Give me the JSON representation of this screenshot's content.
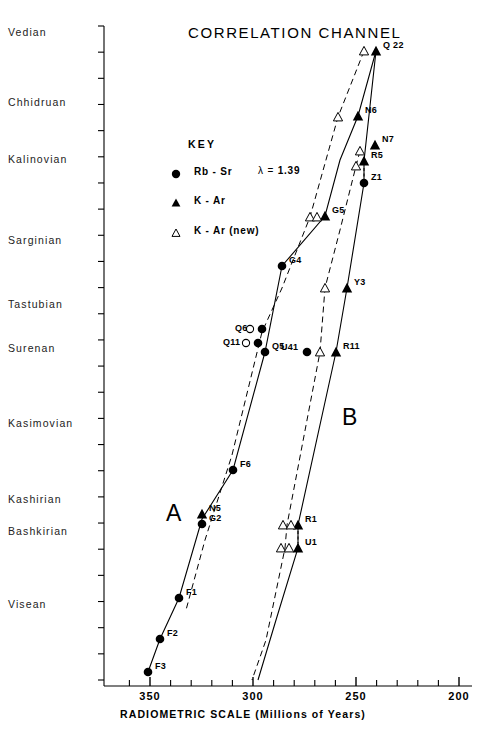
{
  "figure": {
    "title": "CORRELATION CHANNEL",
    "background": "#ffffff",
    "ink": "#000000"
  },
  "key": {
    "heading": "KEY",
    "entries": [
      {
        "symbol": "filled-circle",
        "label": "Rb - Sr",
        "extra_prefix": "λ =",
        "extra_value": "1.39"
      },
      {
        "symbol": "filled-triangle",
        "label": "K - Ar",
        "extra_prefix": "",
        "extra_value": ""
      },
      {
        "symbol": "open-triangle",
        "label": "K - Ar (new)",
        "extra_prefix": "",
        "extra_value": ""
      }
    ]
  },
  "chart_data": {
    "type": "scatter",
    "title": "CORRELATION CHANNEL",
    "xlabel": "RADIOMETRIC SCALE  (Millions of Years)",
    "ylabel": "",
    "xlim": [
      360,
      195
    ],
    "x_reversed": true,
    "grid": false,
    "legend_position": "upper-left-inside",
    "x_ticks_major": [
      350,
      300,
      250,
      200
    ],
    "x_tick_labels": [
      "350",
      "300",
      "250",
      "200"
    ],
    "x_ticks_minor": [
      360,
      340,
      330,
      320,
      310,
      290,
      280,
      270,
      260,
      240,
      230,
      220,
      210
    ],
    "y_axis": {
      "type": "stratigraphic-stages",
      "stages": [
        {
          "name": "Vedian",
          "py": 33
        },
        {
          "name": "Chhidruan",
          "py": 103
        },
        {
          "name": "Kalinovian",
          "py": 160
        },
        {
          "name": "Sarginian",
          "py": 241
        },
        {
          "name": "Tastubian",
          "py": 305
        },
        {
          "name": "Surenan",
          "py": 349
        },
        {
          "name": "Kasimovian",
          "py": 424
        },
        {
          "name": "Kashirian",
          "py": 500
        },
        {
          "name": "Bashkirian",
          "py": 532
        },
        {
          "name": "Visean",
          "py": 605
        }
      ],
      "tick_count": 26,
      "axis_top_py": 26,
      "axis_bottom_py": 680
    },
    "series": [
      {
        "name": "Rb-Sr",
        "symbol": "filled-circle",
        "points": [
          {
            "label": "Z1",
            "px": 364,
            "py": 183
          },
          {
            "label": "G4",
            "px": 282,
            "py": 266
          },
          {
            "label": "Q6",
            "px": 262,
            "py": 329
          },
          {
            "label": "Q11",
            "px": 258,
            "py": 343
          },
          {
            "label": "Q5",
            "px": 265,
            "py": 352
          },
          {
            "label": "U41",
            "px": 307,
            "py": 352
          },
          {
            "label": "F6",
            "px": 233,
            "py": 470
          },
          {
            "label": "G2",
            "px": 202,
            "py": 524
          },
          {
            "label": "F1",
            "px": 179,
            "py": 598
          },
          {
            "label": "F2",
            "px": 160,
            "py": 639
          },
          {
            "label": "F3",
            "px": 148,
            "py": 672
          }
        ]
      },
      {
        "name": "K-Ar",
        "symbol": "filled-triangle",
        "points": [
          {
            "label": "Q 22",
            "px": 376,
            "py": 51
          },
          {
            "label": "N6",
            "px": 358,
            "py": 116
          },
          {
            "label": "N7",
            "px": 375,
            "py": 145
          },
          {
            "label": "R5",
            "px": 364,
            "py": 161
          },
          {
            "label": "G5",
            "px": 325,
            "py": 216
          },
          {
            "label": "Y3",
            "px": 347,
            "py": 288
          },
          {
            "label": "R11",
            "px": 336,
            "py": 352
          },
          {
            "label": "N5",
            "px": 202,
            "py": 514
          },
          {
            "label": "R1",
            "px": 298,
            "py": 525
          },
          {
            "label": "U1",
            "px": 298,
            "py": 548
          }
        ]
      },
      {
        "name": "K-Ar (new)",
        "symbol": "open-triangle",
        "points": [
          {
            "label": "",
            "px": 364,
            "py": 51
          },
          {
            "label": "",
            "px": 338,
            "py": 117
          },
          {
            "label": "",
            "px": 360,
            "py": 151
          },
          {
            "label": "",
            "px": 356,
            "py": 166
          },
          {
            "label": "",
            "px": 310,
            "py": 217
          },
          {
            "label": "",
            "px": 317,
            "py": 217
          },
          {
            "label": "",
            "px": 325,
            "py": 288
          },
          {
            "label": "",
            "px": 320,
            "py": 352
          },
          {
            "label": "",
            "px": 283,
            "py": 525
          },
          {
            "label": "",
            "px": 291,
            "py": 525
          },
          {
            "label": "",
            "px": 281,
            "py": 548
          },
          {
            "label": "",
            "px": 289,
            "py": 548
          }
        ]
      }
    ],
    "curves": [
      {
        "name": "A",
        "style": "solid",
        "label_px": 166,
        "label_py": 516,
        "path": [
          [
            376,
            51
          ],
          [
            358,
            116
          ],
          [
            340,
            160
          ],
          [
            325,
            216
          ],
          [
            282,
            266
          ],
          [
            265,
            352
          ],
          [
            233,
            470
          ],
          [
            202,
            519
          ],
          [
            179,
            598
          ],
          [
            160,
            639
          ],
          [
            148,
            672
          ]
        ]
      },
      {
        "name": "A-new",
        "style": "dashed",
        "label_px": null,
        "label_py": null,
        "path": [
          [
            364,
            51
          ],
          [
            338,
            117
          ],
          [
            310,
            217
          ],
          [
            282,
            288
          ],
          [
            262,
            332
          ],
          [
            232,
            455
          ],
          [
            205,
            540
          ],
          [
            186,
            610
          ]
        ]
      },
      {
        "name": "B",
        "style": "solid",
        "label_px": 342,
        "label_py": 420,
        "path": [
          [
            376,
            51
          ],
          [
            364,
            161
          ],
          [
            364,
            183
          ],
          [
            347,
            288
          ],
          [
            336,
            352
          ],
          [
            298,
            525
          ],
          [
            298,
            548
          ],
          [
            276,
            620
          ],
          [
            258,
            680
          ]
        ]
      },
      {
        "name": "B-new",
        "style": "dashed",
        "label_px": null,
        "label_py": null,
        "path": [
          [
            360,
            151
          ],
          [
            356,
            166
          ],
          [
            340,
            230
          ],
          [
            325,
            288
          ],
          [
            320,
            352
          ],
          [
            287,
            525
          ],
          [
            285,
            548
          ],
          [
            266,
            640
          ],
          [
            252,
            680
          ]
        ]
      }
    ],
    "annotations": [
      {
        "text": "A",
        "px": 166,
        "py": 516
      },
      {
        "text": "B",
        "px": 342,
        "py": 420
      }
    ]
  }
}
